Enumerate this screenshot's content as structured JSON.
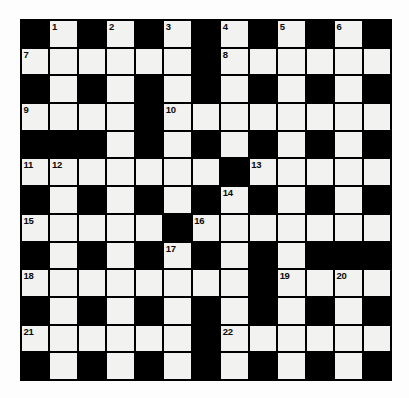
{
  "puzzle": {
    "title": "Crossword Grid",
    "columns": 13,
    "rows": 13,
    "colors": {
      "block": "#000000",
      "cell": "#f2f2f0",
      "grid_line": "#000000",
      "page_background": "#fdfdfd",
      "number_text": "#0a0a0a"
    },
    "grid": [
      [
        "B",
        "1",
        "B",
        "2",
        "B",
        "3",
        "B",
        "4",
        "B",
        "5",
        "B",
        "6",
        "B"
      ],
      [
        "7",
        "",
        "",
        "",
        "",
        "",
        "B",
        "8",
        "",
        "",
        "",
        "",
        ""
      ],
      [
        "B",
        "",
        "B",
        "",
        "B",
        "",
        "B",
        "",
        "B",
        "",
        "B",
        "",
        "B"
      ],
      [
        "9",
        "",
        "",
        "",
        "B",
        "10",
        "",
        "",
        "",
        "",
        "",
        "",
        ""
      ],
      [
        "B",
        "B",
        "B",
        "",
        "B",
        "",
        "B",
        "",
        "B",
        "",
        "B",
        "",
        "B"
      ],
      [
        "11",
        "12",
        "",
        "",
        "",
        "",
        "",
        "B",
        "13",
        "",
        "",
        "",
        ""
      ],
      [
        "B",
        "",
        "B",
        "",
        "B",
        "",
        "B",
        "14",
        "B",
        "",
        "B",
        "",
        "B"
      ],
      [
        "15",
        "",
        "",
        "",
        "",
        "B",
        "16",
        "",
        "",
        "",
        "",
        "",
        ""
      ],
      [
        "B",
        "",
        "B",
        "",
        "B",
        "17",
        "B",
        "",
        "B",
        "",
        "B",
        "B",
        "B"
      ],
      [
        "18",
        "",
        "",
        "",
        "",
        "",
        "",
        "",
        "B",
        "19",
        "",
        "20",
        ""
      ],
      [
        "B",
        "",
        "B",
        "",
        "B",
        "",
        "B",
        "",
        "B",
        "",
        "B",
        "",
        "B"
      ],
      [
        "21",
        "",
        "",
        "",
        "",
        "",
        "B",
        "22",
        "",
        "",
        "",
        "",
        ""
      ],
      [
        "B",
        "",
        "B",
        "",
        "B",
        "",
        "B",
        "",
        "B",
        "",
        "B",
        "",
        "B"
      ]
    ],
    "clue_numbers": [
      1,
      2,
      3,
      4,
      5,
      6,
      7,
      8,
      9,
      10,
      11,
      12,
      13,
      14,
      15,
      16,
      17,
      18,
      19,
      20,
      21,
      22
    ],
    "entries": [
      {
        "number": 1,
        "row": 0,
        "col": 1
      },
      {
        "number": 2,
        "row": 0,
        "col": 3
      },
      {
        "number": 3,
        "row": 0,
        "col": 5
      },
      {
        "number": 4,
        "row": 0,
        "col": 7
      },
      {
        "number": 5,
        "row": 0,
        "col": 9
      },
      {
        "number": 6,
        "row": 0,
        "col": 11
      },
      {
        "number": 7,
        "row": 1,
        "col": 0
      },
      {
        "number": 8,
        "row": 1,
        "col": 7
      },
      {
        "number": 9,
        "row": 3,
        "col": 0
      },
      {
        "number": 10,
        "row": 3,
        "col": 5
      },
      {
        "number": 11,
        "row": 5,
        "col": 0
      },
      {
        "number": 12,
        "row": 5,
        "col": 1
      },
      {
        "number": 13,
        "row": 5,
        "col": 8
      },
      {
        "number": 14,
        "row": 6,
        "col": 7
      },
      {
        "number": 15,
        "row": 7,
        "col": 0
      },
      {
        "number": 16,
        "row": 7,
        "col": 6
      },
      {
        "number": 17,
        "row": 8,
        "col": 5
      },
      {
        "number": 18,
        "row": 9,
        "col": 0
      },
      {
        "number": 19,
        "row": 9,
        "col": 9
      },
      {
        "number": 20,
        "row": 9,
        "col": 11
      },
      {
        "number": 21,
        "row": 11,
        "col": 0
      },
      {
        "number": 22,
        "row": 11,
        "col": 7
      }
    ]
  }
}
